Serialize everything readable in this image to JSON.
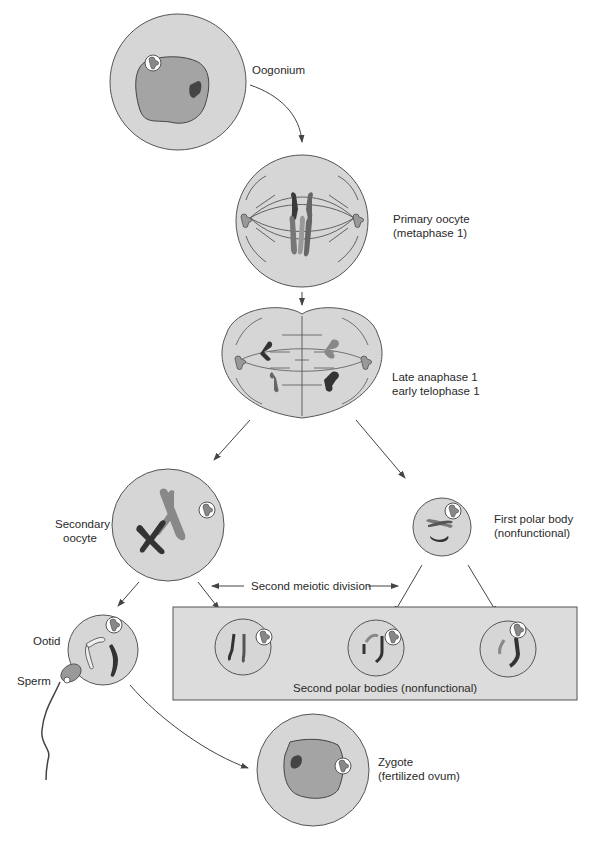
{
  "diagram": {
    "type": "oogenesis",
    "colors": {
      "cell_fill": "#d6d6d6",
      "cell_stroke": "#555555",
      "nucleus_fill": "#a4a4a4",
      "nucleolus_fill": "#444444",
      "chromosome_dark": "#3a3a3a",
      "chromosome_mid": "#8a8a8a",
      "chromosome_light": "#c8c8c8",
      "box_fill": "#dcdcdc",
      "arrow": "#444444"
    },
    "stages": [
      {
        "id": "oogonium",
        "lines": [
          "Oogonium"
        ]
      },
      {
        "id": "primary-oocyte",
        "lines": [
          "Primary oocyte",
          "(metaphase 1)"
        ]
      },
      {
        "id": "anaphase",
        "lines": [
          "Late anaphase 1",
          "early telophase 1"
        ]
      },
      {
        "id": "secondary-oocyte",
        "lines": [
          "Secondary",
          "oocyte"
        ]
      },
      {
        "id": "first-polar-body",
        "lines": [
          "First polar body",
          "(nonfunctional)"
        ]
      },
      {
        "id": "ootid",
        "lines": [
          "Ootid"
        ]
      },
      {
        "id": "sperm",
        "lines": [
          "Sperm"
        ]
      },
      {
        "id": "zygote",
        "lines": [
          "Zygote",
          "(fertilized ovum)"
        ]
      }
    ],
    "second_meiotic_division": "Second meiotic division",
    "second_polar_bodies": "Second polar bodies (nonfunctional)"
  }
}
